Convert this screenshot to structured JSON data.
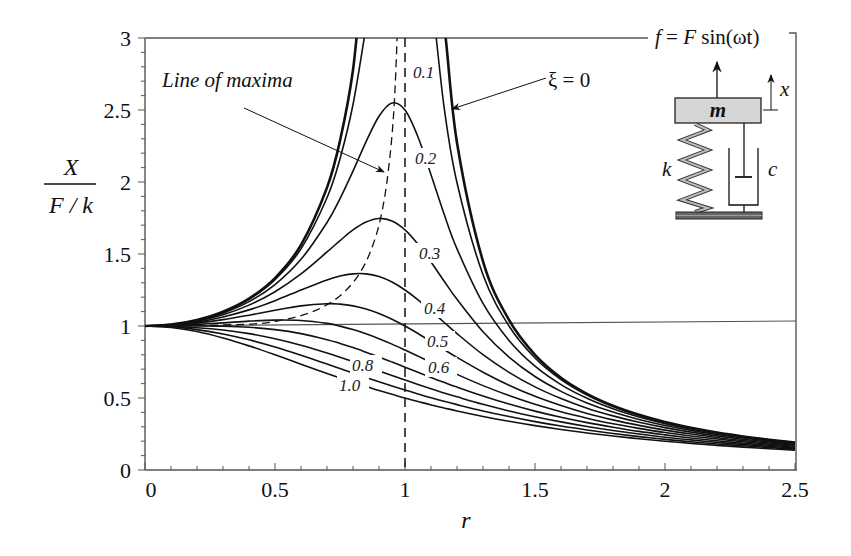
{
  "chart_data": {
    "type": "line",
    "title": "",
    "xlabel": "r",
    "ylabel": "X / (F / k)",
    "ylabel_numerator": "X",
    "ylabel_denominator": "F / k",
    "xlim": [
      0,
      2.5
    ],
    "ylim": [
      0,
      3
    ],
    "x_ticks": [
      "0",
      "0.5",
      "1",
      "1.5",
      "2",
      "2.5"
    ],
    "x_tick_values": [
      0,
      0.5,
      1,
      1.5,
      2,
      2.5
    ],
    "y_ticks": [
      "0",
      "0.5",
      "1",
      "1.5",
      "2",
      "2.5",
      "3"
    ],
    "y_tick_values": [
      0,
      0.5,
      1,
      1.5,
      2,
      2.5,
      3
    ],
    "grid": false,
    "legend": "none (curves labeled inline)",
    "reference_lines": {
      "horizontal_y": 1,
      "vertical_dashed_x": 1
    },
    "x": [
      0,
      0.1,
      0.2,
      0.3,
      0.4,
      0.5,
      0.6,
      0.7,
      0.75,
      0.8,
      0.85,
      0.9,
      0.95,
      1.0,
      1.05,
      1.1,
      1.15,
      1.2,
      1.3,
      1.4,
      1.5,
      1.6,
      1.7,
      1.8,
      1.9,
      2.0,
      2.1,
      2.2,
      2.3,
      2.4,
      2.5
    ],
    "series": [
      {
        "name": "ξ = 0",
        "xi": 0,
        "label": "ξ = 0",
        "values": [
          1,
          1.01,
          1.042,
          1.099,
          1.19,
          1.333,
          1.563,
          1.961,
          2.286,
          2.778,
          3.604,
          5.263,
          10.256,
          null,
          9.756,
          4.762,
          3.101,
          2.273,
          1.449,
          1.042,
          0.8,
          0.641,
          0.529,
          0.446,
          0.383,
          0.333,
          0.293,
          0.26,
          0.233,
          0.21,
          0.19
        ]
      },
      {
        "name": "ξ = 0.1",
        "xi": 0.1,
        "label": "0.1",
        "values": [
          1,
          1.01,
          1.041,
          1.097,
          1.185,
          1.322,
          1.536,
          1.891,
          2.162,
          2.538,
          3.073,
          3.821,
          4.683,
          5.0,
          4.279,
          3.288,
          2.525,
          1.995,
          1.356,
          1.0,
          0.778,
          0.628,
          0.521,
          0.441,
          0.379,
          0.33,
          0.291,
          0.259,
          0.232,
          0.209,
          0.19
        ]
      },
      {
        "name": "ξ = 0.2",
        "xi": 0.2,
        "label": "0.2",
        "values": [
          1,
          1.009,
          1.038,
          1.089,
          1.169,
          1.288,
          1.463,
          1.719,
          1.885,
          2.076,
          2.279,
          2.457,
          2.549,
          2.5,
          2.313,
          2.051,
          1.78,
          1.536,
          1.157,
          0.9,
          0.721,
          0.593,
          0.498,
          0.425,
          0.368,
          0.322,
          0.285,
          0.254,
          0.228,
          0.206,
          0.187
        ]
      },
      {
        "name": "ξ = 0.3",
        "xi": 0.3,
        "label": "0.3",
        "values": [
          1,
          1.008,
          1.034,
          1.078,
          1.145,
          1.238,
          1.362,
          1.514,
          1.593,
          1.667,
          1.722,
          1.747,
          1.729,
          1.667,
          1.567,
          1.444,
          1.313,
          1.185,
          0.96,
          0.784,
          0.649,
          0.546,
          0.466,
          0.402,
          0.351,
          0.309,
          0.275,
          0.246,
          0.222,
          0.201,
          0.183
        ]
      },
      {
        "name": "ξ = 0.4",
        "xi": 0.4,
        "label": "0.4",
        "values": [
          1,
          1.007,
          1.027,
          1.063,
          1.112,
          1.176,
          1.25,
          1.32,
          1.347,
          1.362,
          1.362,
          1.343,
          1.305,
          1.25,
          1.182,
          1.105,
          1.026,
          0.947,
          0.801,
          0.678,
          0.577,
          0.496,
          0.429,
          0.376,
          0.331,
          0.294,
          0.263,
          0.237,
          0.214,
          0.195,
          0.178
        ]
      },
      {
        "name": "ξ = 0.5",
        "xi": 0.5,
        "label": "0.5",
        "values": [
          1,
          1.005,
          1.02,
          1.044,
          1.075,
          1.109,
          1.14,
          1.155,
          1.152,
          1.14,
          1.118,
          1.087,
          1.047,
          1.0,
          0.948,
          0.893,
          0.837,
          0.782,
          0.679,
          0.589,
          0.512,
          0.448,
          0.393,
          0.348,
          0.31,
          0.277,
          0.25,
          0.226,
          0.205,
          0.188,
          0.172
        ]
      },
      {
        "name": "ξ = 0.6",
        "xi": 0.6,
        "label": "0.6",
        "values": [
          1,
          1.003,
          1.011,
          1.022,
          1.034,
          1.041,
          1.038,
          1.018,
          0.999,
          0.975,
          0.946,
          0.912,
          0.874,
          0.833,
          0.791,
          0.748,
          0.706,
          0.664,
          0.586,
          0.517,
          0.456,
          0.404,
          0.36,
          0.321,
          0.289,
          0.26,
          0.236,
          0.215,
          0.196,
          0.18,
          0.165
        ]
      },
      {
        "name": "ξ = 0.7",
        "xi": 0.7,
        "label": "",
        "values": [
          1,
          1.0,
          1.0,
          0.998,
          0.991,
          0.975,
          0.947,
          0.905,
          0.879,
          0.85,
          0.818,
          0.785,
          0.75,
          0.714,
          0.679,
          0.643,
          0.609,
          0.576,
          0.514,
          0.458,
          0.409,
          0.366,
          0.329,
          0.297,
          0.268,
          0.244,
          0.222,
          0.203,
          0.186,
          0.172,
          0.158
        ]
      },
      {
        "name": "ξ = 0.8",
        "xi": 0.8,
        "label": "0.8",
        "values": [
          1,
          0.997,
          0.988,
          0.972,
          0.947,
          0.912,
          0.867,
          0.813,
          0.783,
          0.752,
          0.72,
          0.688,
          0.657,
          0.625,
          0.594,
          0.564,
          0.535,
          0.508,
          0.456,
          0.41,
          0.37,
          0.334,
          0.302,
          0.274,
          0.25,
          0.228,
          0.209,
          0.192,
          0.177,
          0.164,
          0.152
        ]
      },
      {
        "name": "ξ = 0.9",
        "xi": 0.9,
        "label": "",
        "values": [
          1,
          0.994,
          0.975,
          0.945,
          0.904,
          0.854,
          0.797,
          0.736,
          0.705,
          0.674,
          0.643,
          0.613,
          0.584,
          0.556,
          0.528,
          0.502,
          0.477,
          0.454,
          0.41,
          0.371,
          0.336,
          0.305,
          0.278,
          0.254,
          0.232,
          0.213,
          0.196,
          0.181,
          0.168,
          0.156,
          0.145
        ]
      },
      {
        "name": "ξ = 1.0",
        "xi": 1.0,
        "label": "1.0",
        "values": [
          1,
          0.99,
          0.962,
          0.917,
          0.862,
          0.8,
          0.735,
          0.671,
          0.64,
          0.61,
          0.581,
          0.552,
          0.526,
          0.5,
          0.476,
          0.452,
          0.431,
          0.41,
          0.372,
          0.338,
          0.308,
          0.281,
          0.257,
          0.236,
          0.217,
          0.2,
          0.185,
          0.171,
          0.159,
          0.148,
          0.138
        ]
      }
    ],
    "line_of_maxima": {
      "label": "Line of maxima",
      "style": "dashed",
      "points": [
        [
          0.0,
          1.0
        ],
        [
          0.394,
          1.012
        ],
        [
          0.529,
          1.042
        ],
        [
          0.629,
          1.089
        ],
        [
          0.707,
          1.155
        ],
        [
          0.771,
          1.244
        ],
        [
          0.825,
          1.364
        ],
        [
          0.869,
          1.525
        ],
        [
          0.906,
          1.747
        ],
        [
          0.935,
          2.066
        ],
        [
          0.959,
          2.552
        ],
        [
          0.977,
          3.372
        ]
      ]
    },
    "annotations": [
      {
        "text": "Line of maxima",
        "arrow_to": [
          0.93,
          2.05
        ]
      },
      {
        "text": "ξ = 0",
        "arrow_to": [
          1.15,
          2.6
        ]
      },
      {
        "text": "0.1",
        "at": [
          1.06,
          2.7
        ]
      },
      {
        "text": "0.2",
        "at": [
          1.06,
          2.0
        ]
      },
      {
        "text": "0.3",
        "at": [
          1.07,
          1.5
        ]
      },
      {
        "text": "0.4",
        "at": [
          1.08,
          1.09
        ]
      },
      {
        "text": "0.5",
        "at": [
          1.08,
          0.84
        ]
      },
      {
        "text": "0.6",
        "at": [
          1.08,
          0.64
        ]
      },
      {
        "text": "0.8",
        "at": [
          0.6,
          0.64
        ]
      },
      {
        "text": "1.0",
        "at": [
          0.52,
          0.47
        ]
      }
    ]
  },
  "inset": {
    "force_label": "f = F sin(ωt)",
    "force_f": "f",
    "force_eq": " = ",
    "force_F": "F",
    "force_sin": " sin",
    "force_arg": "(ωt)",
    "mass_label": "m",
    "spring_label": "k",
    "damper_label": "c",
    "displacement_label": "x",
    "colors": {
      "mass_fill": "#d6d6d6",
      "spring_fill": "#b8b8b8",
      "base_fill": "#555555"
    }
  },
  "labels": {
    "y_num": "X",
    "y_den": "F / k",
    "x_title": "r",
    "maxima": "Line of maxima",
    "xi0": "ξ = 0"
  }
}
